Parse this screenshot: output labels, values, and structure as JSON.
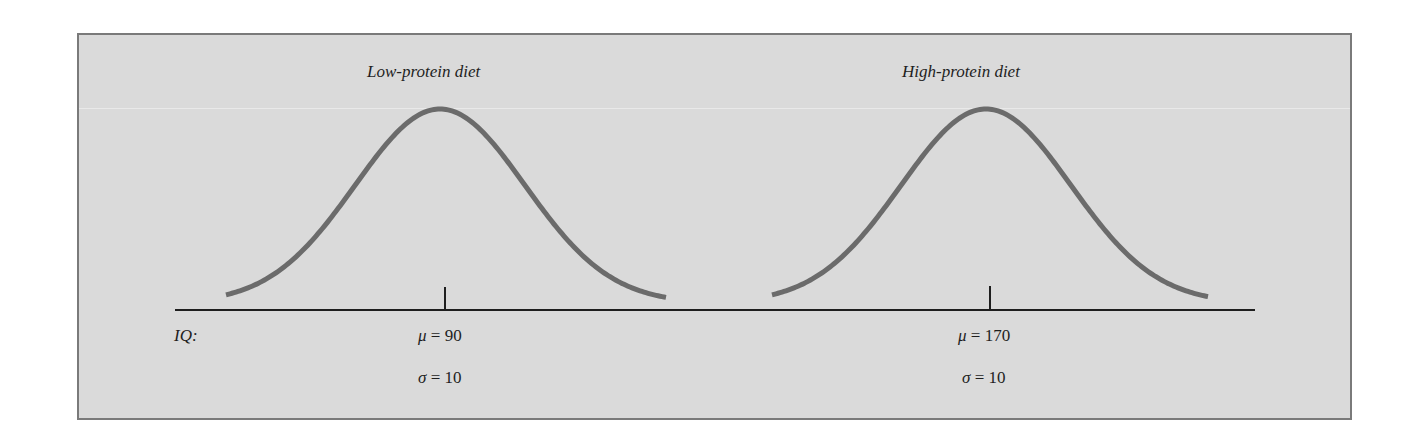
{
  "figure": {
    "axis_label": "IQ:",
    "panels": [
      {
        "heading": "Low-protein diet",
        "mu_label": "μ = 90",
        "mu_symbol": "μ",
        "mu_value": "= 90",
        "sigma_symbol": "σ",
        "sigma_value": "= 10",
        "mean": 90,
        "sd": 10
      },
      {
        "heading": "High-protein diet",
        "mu_symbol": "μ",
        "mu_value": "= 170",
        "sigma_symbol": "σ",
        "sigma_value": "= 10",
        "mean": 170,
        "sd": 10
      }
    ]
  },
  "colors": {
    "background": "#dadada",
    "border": "#7a7a7a",
    "curve": "#6b6b6b",
    "axis": "#1e1e1e",
    "text": "#1e1e1e"
  },
  "chart_data": {
    "type": "line",
    "title": "",
    "xlabel": "IQ",
    "ylabel": "",
    "grid": false,
    "series": [
      {
        "name": "Low-protein diet",
        "distribution": "normal",
        "mean": 90,
        "sd": 10
      },
      {
        "name": "High-protein diet",
        "distribution": "normal",
        "mean": 170,
        "sd": 10
      }
    ],
    "annotations": [
      "μ = 90",
      "σ = 10",
      "μ = 170",
      "σ = 10"
    ]
  }
}
